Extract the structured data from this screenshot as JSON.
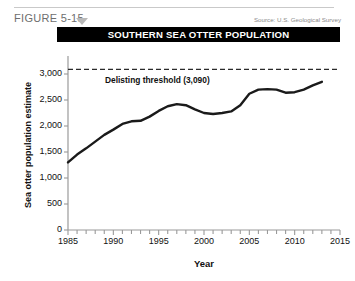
{
  "figure": {
    "label": "FIGURE 5-15",
    "source": "Source: U.S. Geological Survey",
    "title": "SOUTHERN SEA OTTER POPULATION",
    "caret_icon": "triangle-down-icon"
  },
  "chart_data": {
    "type": "line",
    "title": "SOUTHERN SEA OTTER POPULATION",
    "xlabel": "Year",
    "ylabel": "Sea otter population estimate",
    "xlim": [
      1985,
      2015
    ],
    "ylim": [
      0,
      3250
    ],
    "grid": false,
    "legend": "none",
    "y_ticks": [
      0,
      500,
      1000,
      1500,
      2000,
      2500,
      3000
    ],
    "y_tick_labels": [
      "0",
      "500",
      "1,000",
      "1,500",
      "2,000",
      "2,500",
      "3,000"
    ],
    "x_ticks": [
      1985,
      1990,
      1995,
      2000,
      2005,
      2010,
      2015
    ],
    "x_tick_labels": [
      "1985",
      "1990",
      "1995",
      "2000",
      "2005",
      "2010",
      "2015"
    ],
    "x_minor_tick_step": 1,
    "line_color": "#1a1a1a",
    "series": [
      {
        "name": "Sea otter population estimate",
        "x": [
          1985,
          1986,
          1987,
          1988,
          1989,
          1990,
          1991,
          1992,
          1993,
          1994,
          1995,
          1996,
          1997,
          1998,
          1999,
          2000,
          2001,
          2002,
          2003,
          2004,
          2005,
          2006,
          2007,
          2008,
          2009,
          2010,
          2011,
          2012,
          2013
        ],
        "values": [
          1300,
          1450,
          1570,
          1700,
          1830,
          1930,
          2040,
          2090,
          2100,
          2180,
          2290,
          2380,
          2420,
          2400,
          2320,
          2250,
          2230,
          2250,
          2280,
          2400,
          2620,
          2700,
          2710,
          2700,
          2640,
          2650,
          2700,
          2780,
          2850
        ]
      }
    ],
    "annotations": [
      {
        "name": "delisting-threshold",
        "text": "Delisting threshold (3,090)",
        "value": 3090,
        "style": "dashed-horizontal-line"
      }
    ]
  }
}
